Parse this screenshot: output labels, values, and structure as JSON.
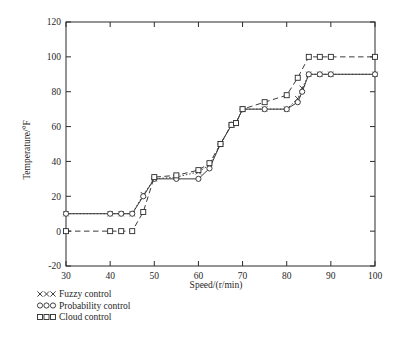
{
  "chart_data": {
    "type": "line",
    "title": "",
    "xlabel": "Speed/(r/min)",
    "ylabel": "Temperature/°F",
    "xlim": [
      30,
      100
    ],
    "ylim": [
      -20,
      120
    ],
    "xticks": [
      30,
      40,
      50,
      60,
      70,
      80,
      90,
      100
    ],
    "yticks": [
      -20,
      0,
      20,
      40,
      60,
      80,
      100,
      120
    ],
    "grid": false,
    "legend_position": "below-left",
    "series": [
      {
        "name": "Fuzzy control",
        "marker": "x",
        "linestyle": "dotted",
        "x": [
          30,
          40,
          42.5,
          45,
          47.5,
          50,
          55,
          60,
          62.5,
          65,
          67.5,
          68.5,
          70,
          75,
          80,
          82.5,
          83.5,
          85,
          87.5,
          90,
          100
        ],
        "y": [
          10,
          10,
          10,
          10,
          21,
          30,
          31,
          34,
          38,
          50,
          61,
          62,
          70,
          70,
          70,
          76,
          82,
          90,
          90,
          90,
          90
        ]
      },
      {
        "name": "Probability control",
        "marker": "o",
        "linestyle": "solid",
        "x": [
          30,
          40,
          42.5,
          45,
          47.5,
          50,
          55,
          60,
          62.5,
          65,
          67.5,
          68.5,
          70,
          75,
          80,
          82.5,
          83.5,
          85,
          87.5,
          90,
          100
        ],
        "y": [
          10,
          10,
          10,
          10,
          20,
          30,
          30,
          30,
          36,
          50,
          61,
          62,
          70,
          70,
          70,
          74,
          80,
          90,
          90,
          90,
          90
        ]
      },
      {
        "name": "Cloud control",
        "marker": "s",
        "linestyle": "dashed",
        "x": [
          30,
          40,
          42.5,
          45,
          47.5,
          50,
          55,
          60,
          62.5,
          65,
          67.5,
          68.5,
          70,
          75,
          80,
          82.5,
          85,
          87.5,
          90,
          100
        ],
        "y": [
          0,
          0,
          0,
          0,
          11,
          31,
          32,
          35,
          39,
          50,
          61,
          62,
          70,
          74,
          78,
          88,
          100,
          100,
          100,
          100
        ]
      }
    ]
  },
  "legend": {
    "items": [
      {
        "label": "Fuzzy control",
        "marker": "x"
      },
      {
        "label": "Probability control",
        "marker": "o"
      },
      {
        "label": "Cloud control",
        "marker": "s"
      }
    ]
  },
  "colors": {
    "axis": "#2b2b2b",
    "series": "#3a3a3a",
    "background": "#ffffff"
  }
}
